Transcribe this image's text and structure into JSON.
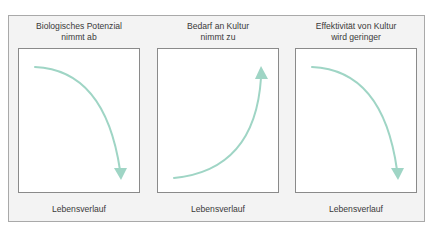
{
  "diagram": {
    "accent_color": "#9fd5c5",
    "panels": [
      {
        "title_line1": "Biologisches Potenzial",
        "title_line2": "nimmt ab",
        "xlabel": "Lebensverlauf",
        "trend": "decreasing",
        "arrow_direction": "down"
      },
      {
        "title_line1": "Bedarf an Kultur",
        "title_line2": "nimmt zu",
        "xlabel": "Lebensverlauf",
        "trend": "increasing",
        "arrow_direction": "up"
      },
      {
        "title_line1": "Effektivität von Kultur",
        "title_line2": "wird geringer",
        "xlabel": "Lebensverlauf",
        "trend": "decreasing",
        "arrow_direction": "down"
      }
    ]
  }
}
